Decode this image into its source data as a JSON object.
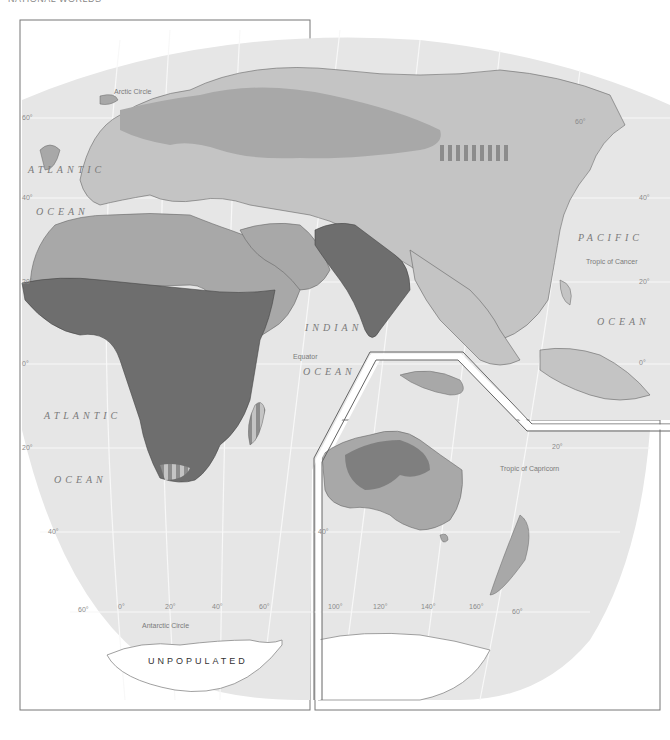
{
  "header": {
    "title": "NATIONAL WORLDS",
    "page": ""
  },
  "map": {
    "oceans": [
      {
        "id": "atlantic-north-1",
        "text": "ATLANTIC",
        "x": 28,
        "y": 170
      },
      {
        "id": "atlantic-north-2",
        "text": "OCEAN",
        "x": 36,
        "y": 212
      },
      {
        "id": "pacific-1",
        "text": "PACIFIC",
        "x": 578,
        "y": 238
      },
      {
        "id": "pacific-2",
        "text": "OCEAN",
        "x": 597,
        "y": 322
      },
      {
        "id": "indian-1",
        "text": "INDIAN",
        "x": 305,
        "y": 328
      },
      {
        "id": "indian-2",
        "text": "OCEAN",
        "x": 303,
        "y": 372
      },
      {
        "id": "atlantic-south-1",
        "text": "ATLANTIC",
        "x": 44,
        "y": 416
      },
      {
        "id": "atlantic-south-2",
        "text": "OCEAN",
        "x": 54,
        "y": 480
      }
    ],
    "lines": [
      {
        "id": "arctic-circle",
        "text": "Arctic Circle",
        "x": 114,
        "y": 92
      },
      {
        "id": "tropic-cancer",
        "text": "Tropic of Cancer",
        "x": 586,
        "y": 262
      },
      {
        "id": "equator",
        "text": "Equator",
        "x": 293,
        "y": 357
      },
      {
        "id": "tropic-capricorn",
        "text": "Tropic of Capricorn",
        "x": 500,
        "y": 469
      },
      {
        "id": "antarctic-circle",
        "text": "Antarctic Circle",
        "x": 142,
        "y": 626
      }
    ],
    "degrees": [
      {
        "text": "60°",
        "x": 22,
        "y": 118
      },
      {
        "text": "40°",
        "x": 22,
        "y": 198
      },
      {
        "text": "20°",
        "x": 22,
        "y": 282
      },
      {
        "text": "0°",
        "x": 22,
        "y": 364
      },
      {
        "text": "20°",
        "x": 22,
        "y": 448
      },
      {
        "text": "40°",
        "x": 48,
        "y": 532
      },
      {
        "text": "60°",
        "x": 78,
        "y": 608
      },
      {
        "text": "0°",
        "x": 118,
        "y": 605
      },
      {
        "text": "20°",
        "x": 165,
        "y": 605
      },
      {
        "text": "40°",
        "x": 212,
        "y": 605
      },
      {
        "text": "60°",
        "x": 259,
        "y": 605
      },
      {
        "text": "60°",
        "x": 575,
        "y": 122
      },
      {
        "text": "40°",
        "x": 639,
        "y": 198
      },
      {
        "text": "20°",
        "x": 639,
        "y": 282
      },
      {
        "text": "0°",
        "x": 639,
        "y": 363
      },
      {
        "text": "20°",
        "x": 552,
        "y": 447
      },
      {
        "text": "40°",
        "x": 318,
        "y": 532
      },
      {
        "text": "100°",
        "x": 328,
        "y": 605
      },
      {
        "text": "120°",
        "x": 373,
        "y": 605
      },
      {
        "text": "140°",
        "x": 421,
        "y": 605
      },
      {
        "text": "160°",
        "x": 469,
        "y": 605
      },
      {
        "text": "60°",
        "x": 512,
        "y": 610
      }
    ],
    "unpopulated_label": "UNPOPULATED",
    "colors": {
      "background": "#ffffff",
      "ocean": "#e6e6e6",
      "land_light": "#c4c4c4",
      "land_medium": "#a8a8a8",
      "land_dark": "#6e6e6e",
      "grid": "#f7f7f7",
      "frame": "#666666"
    }
  }
}
